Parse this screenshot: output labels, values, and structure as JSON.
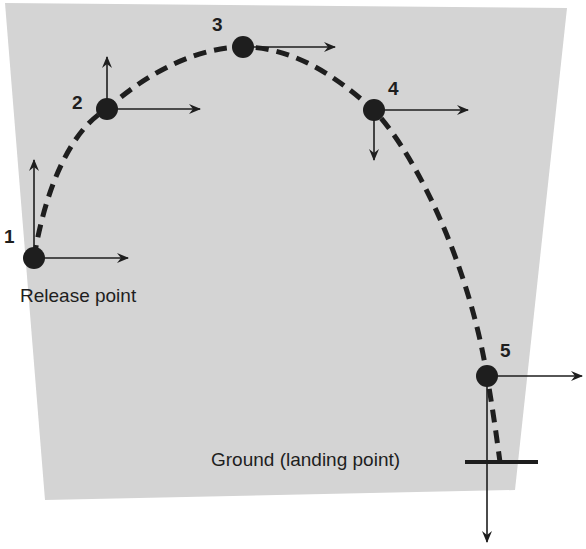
{
  "diagram": {
    "background_color": "#d4d4d4",
    "points": [
      {
        "label": "1",
        "x": 34,
        "y": 258
      },
      {
        "label": "2",
        "x": 107,
        "y": 109
      },
      {
        "label": "3",
        "x": 243,
        "y": 47
      },
      {
        "label": "4",
        "x": 374,
        "y": 110
      },
      {
        "label": "5",
        "x": 487,
        "y": 376
      }
    ],
    "captions": {
      "release": "Release point",
      "ground": "Ground (landing point)"
    }
  }
}
